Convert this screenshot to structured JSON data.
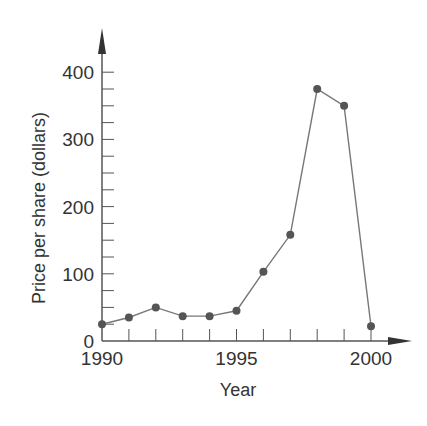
{
  "chart_data": {
    "type": "line",
    "title": "",
    "xlabel": "Year",
    "ylabel": "Price per share (dollars)",
    "x": [
      1990,
      1991,
      1992,
      1993,
      1994,
      1995,
      1996,
      1997,
      1998,
      1999,
      2000
    ],
    "values": [
      25,
      35,
      50,
      37,
      37,
      45,
      103,
      158,
      375,
      350,
      22
    ],
    "xlim": [
      1990,
      2001
    ],
    "ylim": [
      0,
      400
    ],
    "x_tick_labels": [
      "1990",
      "1995",
      "2000"
    ],
    "x_minor_ticks_every": 1,
    "y_tick_labels": [
      "0",
      "100",
      "200",
      "300",
      "400"
    ],
    "y_minor_ticks_every": 25,
    "grid": false,
    "legend": null,
    "markers": true,
    "colors": {
      "line": "#777777",
      "marker": "#555555",
      "axis": "#555555",
      "text": "#333333"
    }
  }
}
